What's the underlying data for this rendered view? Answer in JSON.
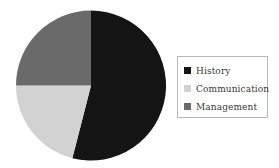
{
  "chart_data": {
    "type": "pie",
    "title": "",
    "subtitle": "",
    "xlabel": "",
    "ylabel": "",
    "grid": false,
    "legend_position": "right",
    "start_angle_deg": 0,
    "direction": "clockwise",
    "categories": [
      "History",
      "Communication",
      "Management"
    ],
    "values": [
      54,
      21,
      25
    ],
    "colors": [
      "#141414",
      "#d2d2d2",
      "#6a6a6a"
    ],
    "slices": [
      {
        "label": "History",
        "value": 54,
        "color": "#141414",
        "start_deg": 0,
        "end_deg": 194.4
      },
      {
        "label": "Communication",
        "value": 21,
        "color": "#d2d2d2",
        "start_deg": 194.4,
        "end_deg": 270.0
      },
      {
        "label": "Management",
        "value": 25,
        "color": "#6a6a6a",
        "start_deg": 270.0,
        "end_deg": 360.0
      }
    ],
    "annotations": []
  },
  "legend": {
    "border_color": "#b9b9b9",
    "items": [
      {
        "label": "History",
        "color": "#141414"
      },
      {
        "label": "Communication",
        "color": "#d2d2d2"
      },
      {
        "label": "Management",
        "color": "#6a6a6a"
      }
    ]
  },
  "figure": {
    "background": "#ffffff",
    "pie_center": {
      "x": 91,
      "y": 85
    },
    "pie_radius": 75
  }
}
